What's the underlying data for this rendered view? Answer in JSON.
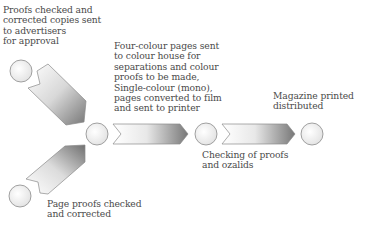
{
  "diagram": {
    "type": "process-flow",
    "labels": {
      "advertisers": "Proofs checked and\ncorrected copies sent\nto advertisers\nfor approval",
      "colour_house": "Four-colour pages sent\nto colour house for\nseparations and colour\nproofs to be made,\nSingle-colour (mono),\npages converted to film\nand sent to printer",
      "page_proofs": "Page proofs checked\nand corrected",
      "ozalids": "Checking of proofs\nand ozalids",
      "printed": "Magazine printed\ndistributed"
    },
    "nodes": [
      {
        "id": "advertisers",
        "icon": "circle-node"
      },
      {
        "id": "page_proofs",
        "icon": "circle-node"
      },
      {
        "id": "colour_house",
        "icon": "circle-node"
      },
      {
        "id": "ozalids",
        "icon": "circle-node"
      },
      {
        "id": "printed",
        "icon": "circle-node"
      }
    ],
    "edges": [
      {
        "from": "advertisers",
        "to": "colour_house"
      },
      {
        "from": "page_proofs",
        "to": "colour_house"
      },
      {
        "from": "colour_house",
        "to": "ozalids"
      },
      {
        "from": "ozalids",
        "to": "printed"
      }
    ],
    "colors": {
      "stroke": "#8a8a8a",
      "arrow_dark": "#7a7a7a",
      "arrow_light": "#ffffff",
      "text": "#4a4a4a"
    }
  }
}
